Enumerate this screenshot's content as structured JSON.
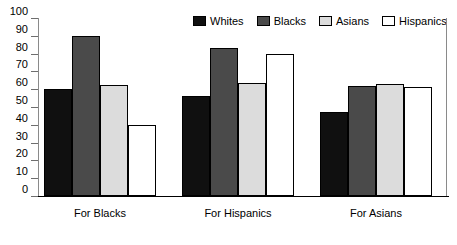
{
  "chart_data": {
    "type": "bar",
    "title": "",
    "xlabel": "",
    "ylabel": "",
    "ylim": [
      0,
      100
    ],
    "ytick_step": 10,
    "grid": false,
    "legend_position": "top-right",
    "categories": [
      "For Blacks",
      "For Hispanics",
      "For Asians"
    ],
    "yticks": [
      "100",
      "90",
      "80",
      "70",
      "60",
      "50",
      "40",
      "30",
      "20",
      "10",
      "0"
    ],
    "ytick_values": [
      100,
      90,
      80,
      70,
      60,
      50,
      40,
      30,
      20,
      10,
      0
    ],
    "series": [
      {
        "name": "Whites",
        "color": "#101010",
        "border": "#000000",
        "values": [
          60,
          56,
          47
        ]
      },
      {
        "name": "Blacks",
        "color": "#4a4a4a",
        "border": "#000000",
        "values": [
          90,
          83,
          62
        ]
      },
      {
        "name": "Asians",
        "color": "#dcdcdc",
        "border": "#000000",
        "values": [
          62.5,
          63.5,
          63
        ]
      },
      {
        "name": "Hispanics",
        "color": "#ffffff",
        "border": "#000000",
        "values": [
          40,
          80,
          61.5
        ]
      }
    ]
  },
  "legend": {
    "items": [
      {
        "label": "Whites",
        "color": "#101010"
      },
      {
        "label": "Blacks",
        "color": "#4a4a4a"
      },
      {
        "label": "Asians",
        "color": "#dcdcdc"
      },
      {
        "label": "Hispanics",
        "color": "#ffffff"
      }
    ]
  },
  "axis": {
    "y_labels": [
      "100",
      "90",
      "80",
      "70",
      "60",
      "50",
      "40",
      "30",
      "20",
      "10",
      "0"
    ],
    "x_labels": [
      "For Blacks",
      "For Hispanics",
      "For Asians"
    ]
  }
}
